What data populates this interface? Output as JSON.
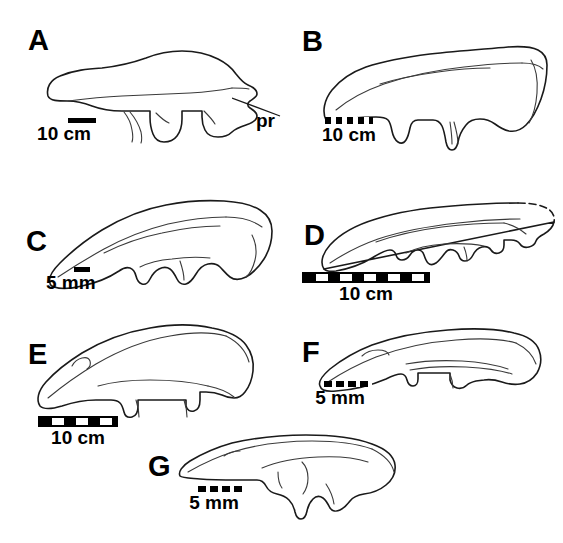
{
  "figure": {
    "background_color": "#ffffff",
    "ink_color": "#1a1a1a",
    "width": 563,
    "height": 543
  },
  "panels": [
    {
      "id": "A",
      "letter": "A",
      "scalebar": {
        "style": "solid",
        "value": "10 cm",
        "unit": "cm",
        "magnitude": 10
      },
      "annotations": [
        {
          "label": "pr",
          "meaning": "process"
        }
      ]
    },
    {
      "id": "B",
      "letter": "B",
      "scalebar": {
        "style": "striped",
        "value": "10 cm",
        "unit": "cm",
        "magnitude": 10
      },
      "annotations": []
    },
    {
      "id": "C",
      "letter": "C",
      "scalebar": {
        "style": "solid",
        "value": "5 mm",
        "unit": "mm",
        "magnitude": 5
      },
      "annotations": []
    },
    {
      "id": "D",
      "letter": "D",
      "scalebar": {
        "style": "boxed",
        "value": "10 cm",
        "unit": "cm",
        "magnitude": 10
      },
      "annotations": []
    },
    {
      "id": "E",
      "letter": "E",
      "scalebar": {
        "style": "boxed",
        "value": "10 cm",
        "unit": "cm",
        "magnitude": 10
      },
      "annotations": []
    },
    {
      "id": "F",
      "letter": "F",
      "scalebar": {
        "style": "dashed",
        "value": "5 mm",
        "unit": "mm",
        "magnitude": 5
      },
      "annotations": []
    },
    {
      "id": "G",
      "letter": "G",
      "scalebar": {
        "style": "dashed",
        "value": "5 mm",
        "unit": "mm",
        "magnitude": 5
      },
      "annotations": []
    }
  ]
}
